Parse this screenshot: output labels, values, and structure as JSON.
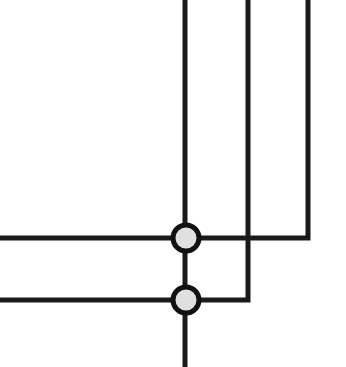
{
  "diagram": {
    "type": "wire-crossing",
    "background": "#ffffff",
    "line_color": "#1a1a1a",
    "line_width": 5,
    "junction_fill": "#e0e0e0",
    "junction_stroke": "#111111",
    "wires": [
      {
        "id": "v1",
        "points": "185,0 185,367"
      },
      {
        "id": "v2",
        "points": "248,0 248,300 0,300"
      },
      {
        "id": "v3",
        "points": "308,0 308,238 0,238"
      }
    ],
    "junctions": [
      {
        "id": "j1",
        "cx": 186,
        "cy": 238,
        "r": 13
      },
      {
        "id": "j2",
        "cx": 186,
        "cy": 300,
        "r": 13
      }
    ]
  }
}
